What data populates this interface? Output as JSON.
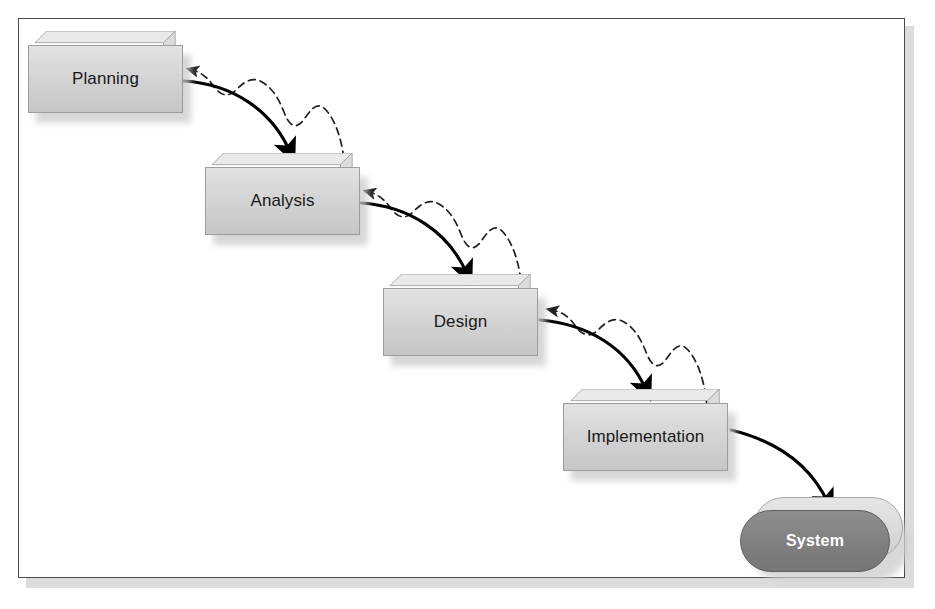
{
  "diagram": {
    "type": "waterfall-lifecycle",
    "colors": {
      "page_background": "#ffffff",
      "frame_border": "#4a4a4a",
      "frame_shadow": "#dcdcdc",
      "box_front": "#d2d2d2",
      "box_top": "#e8e8e8",
      "box_side": "#dadada",
      "box_outline": "#9d9d9d",
      "system_fill": "#7e7e7e",
      "system_text": "#ffffff",
      "arrow_solid": "#000000",
      "arrow_dashed": "#2b2b2b",
      "label_text": "#1a1a1a"
    },
    "stages": [
      {
        "id": "planning",
        "label": "Planning",
        "shape": "3d-box",
        "x": 28,
        "y": 45,
        "w": 155,
        "h": 68,
        "label_x": 28,
        "label_y": 45,
        "label_w": 155,
        "label_h": 68
      },
      {
        "id": "analysis",
        "label": "Analysis",
        "shape": "3d-box",
        "x": 205,
        "y": 167,
        "w": 155,
        "h": 68,
        "label_x": 205,
        "label_y": 167,
        "label_w": 155,
        "label_h": 68
      },
      {
        "id": "design",
        "label": "Design",
        "shape": "3d-box",
        "x": 383,
        "y": 288,
        "w": 155,
        "h": 68,
        "label_x": 383,
        "label_y": 288,
        "label_w": 155,
        "label_h": 68
      },
      {
        "id": "implementation",
        "label": "Implementation",
        "shape": "3d-box",
        "x": 563,
        "y": 403,
        "w": 165,
        "h": 68,
        "label_x": 563,
        "label_y": 403,
        "label_w": 165,
        "label_h": 68
      },
      {
        "id": "system",
        "label": "System",
        "shape": "rounded-pill-3d",
        "x": 740,
        "y": 497,
        "w": 150,
        "h": 75
      }
    ],
    "flow_arrows": [
      {
        "id": "planning-to-analysis",
        "from": "planning",
        "to": "analysis",
        "style": "solid"
      },
      {
        "id": "analysis-to-design",
        "from": "analysis",
        "to": "design",
        "style": "solid"
      },
      {
        "id": "design-to-implementation",
        "from": "design",
        "to": "implementation",
        "style": "solid"
      },
      {
        "id": "implementation-to-system",
        "from": "implementation",
        "to": "system",
        "style": "solid"
      }
    ],
    "feedback_arrows": [
      {
        "id": "analysis-to-planning",
        "from": "analysis",
        "to": "planning",
        "style": "dashed-wavy"
      },
      {
        "id": "design-to-analysis",
        "from": "design",
        "to": "analysis",
        "style": "dashed-wavy"
      },
      {
        "id": "implementation-to-design",
        "from": "implementation",
        "to": "design",
        "style": "dashed-wavy"
      }
    ]
  }
}
